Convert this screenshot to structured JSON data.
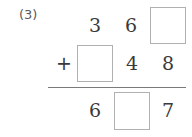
{
  "worksheet": {
    "problem_label": "(3)",
    "operation": "addition",
    "background_color": "#ffffff",
    "digit_color": "#3a3a3a",
    "box_border_color": "#b0b0b0",
    "rule_color": "#7a7a7a"
  },
  "problem": {
    "addend_1": {
      "cells": [
        {
          "type": "digit",
          "value": "3"
        },
        {
          "type": "digit",
          "value": "6"
        },
        {
          "type": "blank",
          "value": ""
        }
      ]
    },
    "addend_2": {
      "operator": "+",
      "cells": [
        {
          "type": "blank",
          "value": ""
        },
        {
          "type": "digit",
          "value": "4"
        },
        {
          "type": "digit",
          "value": "8"
        }
      ]
    },
    "sum": {
      "cells": [
        {
          "type": "digit",
          "value": "6"
        },
        {
          "type": "blank",
          "value": ""
        },
        {
          "type": "digit",
          "value": "7"
        }
      ]
    }
  }
}
